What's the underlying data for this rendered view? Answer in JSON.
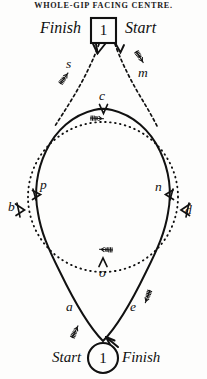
{
  "figure": {
    "title": "WHOLE-GIP  FACING  CENTRE.",
    "top": {
      "finish_label": "Finish",
      "marker_number": "1",
      "start_label": "Start"
    },
    "bottom": {
      "start_label": "Start",
      "marker_number": "1",
      "finish_label": "Finish"
    },
    "point_labels": {
      "s": "s",
      "m": "m",
      "c": "c",
      "p": "p",
      "n": "n",
      "b": "b",
      "d": "d",
      "o": "o",
      "a": "a",
      "e": "e"
    },
    "colors": {
      "ink": "#111111",
      "paper": "#fdfdfc"
    }
  }
}
